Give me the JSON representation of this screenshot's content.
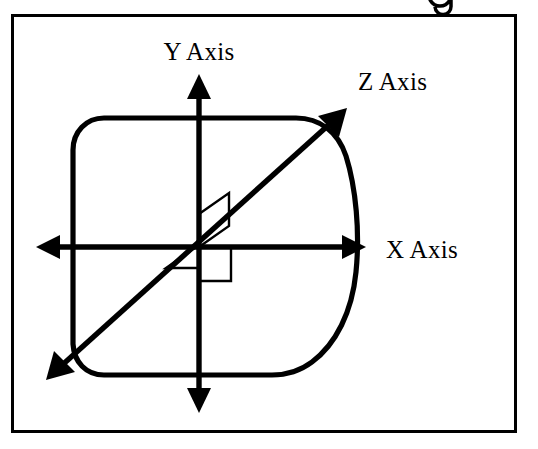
{
  "figure": {
    "background_color": "#ffffff",
    "ink_color": "#000000",
    "width": 538,
    "height": 449,
    "frame": {
      "name": "figure-border",
      "x": 11,
      "y": 14,
      "width": 505,
      "height": 418,
      "stroke_width": 3,
      "color": "#000000"
    },
    "clipped_top_glyph": "g",
    "labels": {
      "y_axis": "Y Axis",
      "z_axis": "Z Axis",
      "x_axis": "X Axis"
    },
    "origin": {
      "x": 199,
      "y": 247
    },
    "axes": [
      {
        "id": "y-axis",
        "label": "Y Axis",
        "orientation": "vertical",
        "direction": "bidirectional",
        "label_position": {
          "x": 199,
          "y": 55
        },
        "start": {
          "x": 199,
          "y": 75
        },
        "end": {
          "x": 199,
          "y": 412
        },
        "arrowheads": [
          "up",
          "down"
        ],
        "stroke_width": 5
      },
      {
        "id": "x-axis",
        "label": "X Axis",
        "orientation": "horizontal",
        "direction": "bidirectional",
        "label_position": {
          "x": 385,
          "y": 256
        },
        "start": {
          "x": 37,
          "y": 247
        },
        "end": {
          "x": 365,
          "y": 247
        },
        "arrowheads": [
          "left",
          "right"
        ],
        "stroke_width": 5
      },
      {
        "id": "z-axis",
        "label": "Z Axis",
        "orientation": "diagonal",
        "direction": "bidirectional",
        "label_position": {
          "x": 358,
          "y": 86
        },
        "start": {
          "x": 48,
          "y": 378
        },
        "end": {
          "x": 345,
          "y": 110
        },
        "arrowheads": [
          "lower-left",
          "upper-right"
        ],
        "stroke_width": 5
      }
    ],
    "body_outline": {
      "name": "rounded-blob-outline",
      "description": "rounded square body whose lower-right side bulges outward",
      "stroke_width": 5,
      "bounds": {
        "left": 72,
        "top": 118,
        "right": 355,
        "bottom": 375
      }
    },
    "right_angle_markers": [
      {
        "id": "angle-marker-y-z",
        "description": "right angle between Y axis and Z axis, upper region",
        "quadrant": "upper"
      },
      {
        "id": "angle-marker-x-z",
        "description": "right angle between negative X axis and Z axis, left region",
        "quadrant": "left"
      },
      {
        "id": "angle-marker-x-y",
        "description": "right angle square between positive X axis and negative Y axis",
        "quadrant": "lower-right"
      }
    ]
  }
}
